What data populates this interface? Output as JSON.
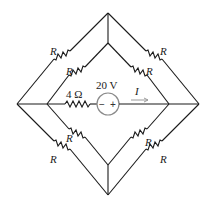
{
  "diagram": {
    "type": "circuit",
    "resistors": [
      {
        "id": "outer-upper-left",
        "label": "R"
      },
      {
        "id": "inner-upper-left",
        "label": "R"
      },
      {
        "id": "outer-upper-right",
        "label": "R"
      },
      {
        "id": "inner-upper-right",
        "label": "R"
      },
      {
        "id": "inner-lower-left",
        "label": "R"
      },
      {
        "id": "outer-lower-left",
        "label": "R"
      },
      {
        "id": "inner-lower-right",
        "label": "R"
      },
      {
        "id": "outer-lower-right",
        "label": "R"
      }
    ],
    "series_resistor": {
      "label": "4 Ω"
    },
    "source": {
      "label": "20 V",
      "minus": "−",
      "plus": "+"
    },
    "current": {
      "label": "I"
    },
    "colors": {
      "wire": "#1a1a1a",
      "source": "#8a8a8a",
      "arrow": "#9a9a9a"
    }
  }
}
